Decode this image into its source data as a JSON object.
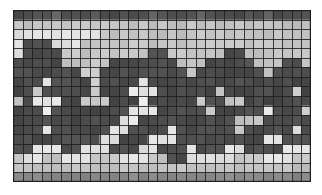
{
  "figure": {
    "title": "",
    "kind": "grayscale-grid-mosaic",
    "background_color": "#ffffff"
  },
  "grid": {
    "columns": 31,
    "rows": 18,
    "cell_width_px": 9.6,
    "cell_height_px": 9.55,
    "origin_x_px": 13,
    "origin_y_px": 10,
    "width_px": 298,
    "height_px": 172,
    "gridline_color": "#262626",
    "gridline_width_px": 1,
    "outer_border_color": "#1f1f1f"
  },
  "palette": {
    "dark": "#3d3d3d",
    "mid_dark": "#545454",
    "mid": "#7a7a7a",
    "mid_light": "#a2a2a2",
    "light": "#c4c4c4",
    "bright": "#e2e2e2",
    "white": "#f2f2f2"
  },
  "chart_data": {
    "type": "heatmap",
    "title": "",
    "xlabel": "",
    "ylabel": "",
    "grid": true,
    "legend": "none",
    "colormap": "gray",
    "vmin": 0,
    "vmax": 7,
    "ncols": 31,
    "nrows": 18,
    "xtick_labels": [],
    "ytick_labels": [],
    "values": [
      [
        2,
        2,
        2,
        2,
        3,
        2,
        2,
        2,
        3,
        2,
        2,
        2,
        2,
        2,
        3,
        2,
        2,
        2,
        2,
        3,
        2,
        2,
        2,
        2,
        2,
        2,
        3,
        2,
        2,
        2,
        2
      ],
      [
        5,
        5,
        5,
        5,
        5,
        5,
        5,
        5,
        5,
        5,
        5,
        5,
        5,
        5,
        5,
        5,
        5,
        5,
        5,
        5,
        5,
        5,
        5,
        5,
        5,
        5,
        5,
        5,
        5,
        5,
        5
      ],
      [
        6,
        6,
        6,
        6,
        6,
        6,
        6,
        6,
        6,
        5,
        5,
        5,
        5,
        5,
        5,
        5,
        5,
        5,
        5,
        5,
        5,
        5,
        5,
        5,
        5,
        5,
        5,
        5,
        5,
        5,
        5
      ],
      [
        6,
        2,
        2,
        2,
        6,
        6,
        6,
        5,
        5,
        5,
        5,
        5,
        5,
        5,
        5,
        5,
        5,
        5,
        5,
        5,
        5,
        5,
        5,
        5,
        5,
        5,
        5,
        5,
        5,
        5,
        5
      ],
      [
        6,
        2,
        2,
        2,
        2,
        5,
        5,
        5,
        5,
        5,
        5,
        5,
        5,
        5,
        2,
        2,
        5,
        5,
        5,
        5,
        5,
        5,
        2,
        2,
        5,
        5,
        5,
        5,
        5,
        5,
        5
      ],
      [
        2,
        2,
        2,
        2,
        2,
        5,
        5,
        5,
        5,
        5,
        2,
        2,
        2,
        2,
        2,
        2,
        2,
        5,
        5,
        5,
        2,
        2,
        2,
        2,
        2,
        5,
        5,
        5,
        2,
        2,
        5
      ],
      [
        2,
        2,
        2,
        2,
        2,
        2,
        2,
        5,
        5,
        2,
        2,
        2,
        2,
        2,
        2,
        2,
        2,
        2,
        5,
        2,
        2,
        2,
        2,
        2,
        2,
        2,
        5,
        2,
        2,
        2,
        2
      ],
      [
        2,
        2,
        2,
        6,
        2,
        2,
        2,
        2,
        5,
        2,
        2,
        2,
        2,
        6,
        2,
        2,
        2,
        2,
        2,
        2,
        2,
        2,
        2,
        2,
        2,
        2,
        2,
        2,
        2,
        2,
        2
      ],
      [
        2,
        2,
        5,
        2,
        2,
        2,
        2,
        2,
        5,
        2,
        2,
        2,
        6,
        6,
        6,
        2,
        2,
        2,
        2,
        2,
        2,
        5,
        2,
        2,
        2,
        2,
        2,
        2,
        2,
        5,
        2
      ],
      [
        5,
        2,
        6,
        6,
        6,
        2,
        2,
        5,
        5,
        5,
        2,
        2,
        2,
        6,
        2,
        2,
        2,
        2,
        2,
        5,
        2,
        2,
        5,
        5,
        2,
        2,
        2,
        2,
        2,
        2,
        2
      ],
      [
        2,
        2,
        2,
        6,
        2,
        2,
        2,
        2,
        2,
        2,
        2,
        2,
        6,
        6,
        6,
        2,
        2,
        2,
        2,
        2,
        5,
        2,
        2,
        2,
        2,
        2,
        6,
        2,
        2,
        2,
        5
      ],
      [
        2,
        2,
        2,
        2,
        2,
        2,
        2,
        2,
        2,
        2,
        2,
        6,
        6,
        2,
        2,
        2,
        2,
        2,
        2,
        2,
        2,
        2,
        2,
        5,
        5,
        5,
        2,
        2,
        2,
        2,
        2
      ],
      [
        2,
        2,
        2,
        6,
        2,
        2,
        2,
        2,
        2,
        2,
        6,
        6,
        2,
        2,
        2,
        2,
        6,
        2,
        2,
        2,
        2,
        2,
        2,
        5,
        2,
        2,
        2,
        2,
        2,
        6,
        2
      ],
      [
        2,
        2,
        2,
        2,
        2,
        2,
        2,
        2,
        2,
        6,
        6,
        2,
        2,
        2,
        6,
        6,
        6,
        2,
        2,
        2,
        2,
        2,
        2,
        2,
        2,
        2,
        6,
        6,
        2,
        2,
        2
      ],
      [
        2,
        2,
        6,
        6,
        6,
        2,
        2,
        6,
        6,
        6,
        2,
        2,
        2,
        6,
        6,
        2,
        2,
        2,
        6,
        2,
        2,
        2,
        6,
        6,
        2,
        2,
        2,
        2,
        6,
        6,
        6
      ],
      [
        5,
        6,
        6,
        5,
        5,
        6,
        6,
        6,
        5,
        5,
        5,
        6,
        6,
        6,
        5,
        5,
        2,
        2,
        6,
        6,
        6,
        6,
        6,
        5,
        5,
        5,
        6,
        6,
        6,
        5,
        5
      ],
      [
        5,
        5,
        5,
        5,
        5,
        5,
        5,
        5,
        5,
        5,
        5,
        5,
        5,
        5,
        5,
        5,
        5,
        5,
        5,
        5,
        5,
        5,
        5,
        5,
        5,
        5,
        5,
        5,
        5,
        5,
        5
      ],
      [
        4,
        4,
        4,
        4,
        4,
        4,
        4,
        4,
        4,
        4,
        4,
        4,
        4,
        4,
        4,
        4,
        4,
        4,
        4,
        4,
        4,
        4,
        4,
        4,
        4,
        4,
        4,
        4,
        4,
        4,
        4
      ]
    ],
    "level_colors": [
      "#2e2e2e",
      "#3a3a3a",
      "#4a4a4a",
      "#5e5e5e",
      "#8a8a8a",
      "#c9c9c9",
      "#e8e8e8",
      "#f5f5f5"
    ]
  }
}
